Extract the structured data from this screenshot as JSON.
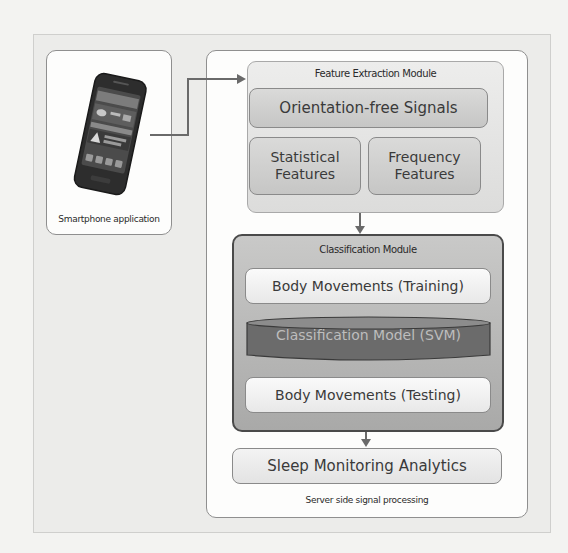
{
  "diagram": {
    "phone_panel": {
      "label": "Smartphone application",
      "icon": "smartphone-icon"
    },
    "server_panel": {
      "caption": "Server side signal processing",
      "feature_extraction": {
        "title": "Feature Extraction Module",
        "orientation_box": "Orientation-free Signals",
        "statistical_box": "Statistical Features",
        "frequency_box": "Frequency Features"
      },
      "classification": {
        "title": "Classification Module",
        "training_box": "Body Movements (Training)",
        "model_box": "Classification Model (SVM)",
        "testing_box": "Body Movements (Testing)"
      },
      "analytics_box": "Sleep Monitoring Analytics"
    },
    "colors": {
      "module_border_dark": "#4a4a4a",
      "model_cylinder": "#6b6b6b",
      "model_text": "#bdbdbd",
      "panel_border": "#8f8f8f"
    }
  }
}
